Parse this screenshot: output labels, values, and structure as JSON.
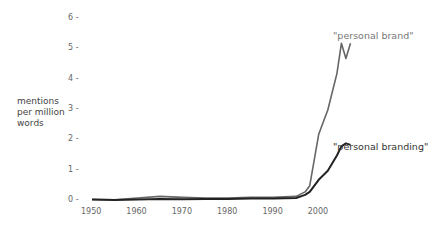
{
  "chart_data": {
    "type": "line",
    "title": "",
    "xlabel": "",
    "ylabel": "mentions per million words",
    "ylim": [
      0,
      6
    ],
    "xlim": [
      1950,
      2008
    ],
    "grid": false,
    "legend_position": "inline-right",
    "y_ticks": [
      "0",
      "1",
      "2",
      "3",
      "4",
      "5",
      "6"
    ],
    "x_ticks": [
      "1950",
      "1960",
      "1970",
      "1980",
      "1990",
      "2000"
    ],
    "x": [
      1950,
      1955,
      1960,
      1965,
      1970,
      1975,
      1980,
      1985,
      1990,
      1995,
      1997,
      1998,
      2000,
      2002,
      2004,
      2005,
      2006,
      2007
    ],
    "series": [
      {
        "name": "\"personal brand\"",
        "color": "#666666",
        "values": [
          0.05,
          0.04,
          0.1,
          0.15,
          0.12,
          0.1,
          0.1,
          0.12,
          0.12,
          0.15,
          0.3,
          0.5,
          2.2,
          3.0,
          4.2,
          5.2,
          4.7,
          5.2
        ]
      },
      {
        "name": "\"personal branding\"",
        "color": "#222222",
        "values": [
          0.05,
          0.03,
          0.05,
          0.07,
          0.06,
          0.07,
          0.07,
          0.08,
          0.08,
          0.1,
          0.2,
          0.3,
          0.7,
          1.0,
          1.5,
          1.8,
          1.9,
          1.85
        ]
      }
    ]
  },
  "labels": {
    "ylabel_lines": [
      "mentions",
      "per million",
      "words"
    ],
    "legend_brand": "\"personal brand\"",
    "legend_branding": "\"personal branding\""
  }
}
